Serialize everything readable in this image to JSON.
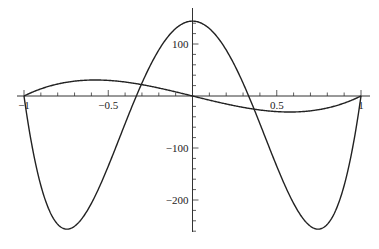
{
  "chart_data": {
    "type": "line",
    "title": "",
    "xlabel": "",
    "ylabel": "",
    "xlim": [
      -1,
      1
    ],
    "ylim": [
      -260,
      150
    ],
    "grid": false,
    "legend": null,
    "x_ticks": [
      -1,
      -0.5,
      0.5,
      1
    ],
    "x_tick_labels": [
      "-1",
      "-0.5",
      "0.5",
      "1"
    ],
    "y_ticks": [
      100,
      -100,
      -200
    ],
    "y_tick_labels": [
      "100",
      "-100",
      "-200"
    ],
    "series": [
      {
        "name": "curve-1",
        "expression": "144*(1-x^2)*(1-9*x^2)",
        "x": [
          -1,
          -0.75,
          -0.5,
          -0.333,
          0,
          0.333,
          0.5,
          0.75,
          1
        ],
        "values": [
          0,
          -256,
          -135,
          0,
          144,
          0,
          -135,
          -256,
          0
        ]
      },
      {
        "name": "curve-2",
        "expression": "80*x*(x^2-1)",
        "x": [
          -1,
          -0.577,
          -0.5,
          0,
          0.5,
          0.577,
          1
        ],
        "values": [
          0,
          30.8,
          30,
          0,
          -30,
          -30.8,
          0
        ]
      }
    ]
  }
}
